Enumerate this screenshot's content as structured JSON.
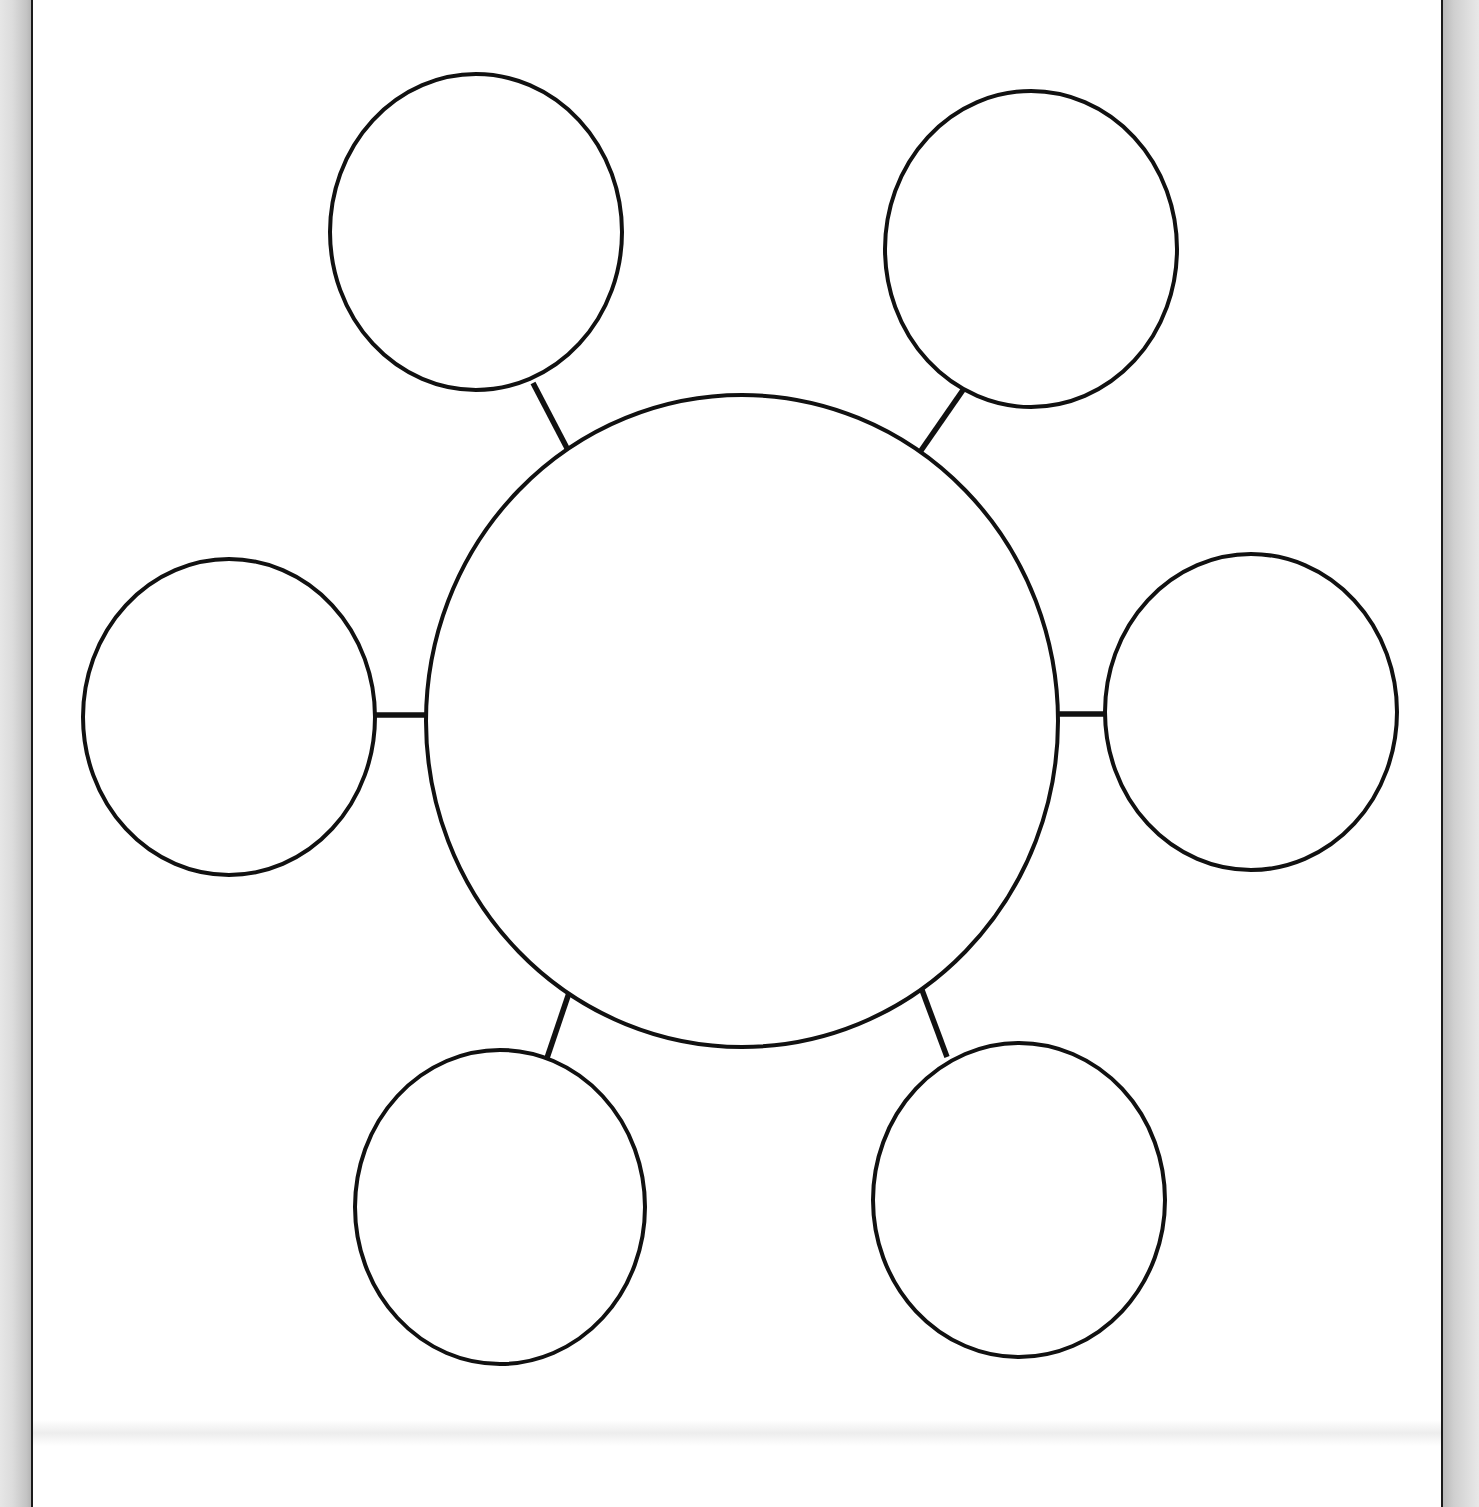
{
  "diagram": {
    "type": "bubble-map",
    "stroke_color": "#111111",
    "fill_color": "#ffffff",
    "central_circle": {
      "cx": 742,
      "cy": 721,
      "rx": 316,
      "ry": 326,
      "label": ""
    },
    "satellites": [
      {
        "id": "top-left",
        "cx": 476,
        "cy": 232,
        "rx": 146,
        "ry": 158,
        "label": ""
      },
      {
        "id": "top-right",
        "cx": 1031,
        "cy": 249,
        "rx": 146,
        "ry": 158,
        "label": ""
      },
      {
        "id": "left",
        "cx": 229,
        "cy": 717,
        "rx": 146,
        "ry": 158,
        "label": ""
      },
      {
        "id": "right",
        "cx": 1251,
        "cy": 712,
        "rx": 146,
        "ry": 158,
        "label": ""
      },
      {
        "id": "bottom-left",
        "cx": 500,
        "cy": 1207,
        "rx": 145,
        "ry": 157,
        "label": ""
      },
      {
        "id": "bottom-right",
        "cx": 1019,
        "cy": 1200,
        "rx": 146,
        "ry": 157,
        "label": ""
      }
    ],
    "connectors": [
      {
        "id": "top-left",
        "x1": 533,
        "y1": 383,
        "x2": 569,
        "y2": 452
      },
      {
        "id": "top-right",
        "x1": 963,
        "y1": 390,
        "x2": 920,
        "y2": 452
      },
      {
        "id": "left",
        "x1": 375,
        "y1": 715,
        "x2": 428,
        "y2": 715
      },
      {
        "id": "right",
        "x1": 1058,
        "y1": 714,
        "x2": 1105,
        "y2": 714
      },
      {
        "id": "bottom-left",
        "x1": 570,
        "y1": 990,
        "x2": 547,
        "y2": 1058
      },
      {
        "id": "bottom-right",
        "x1": 922,
        "y1": 990,
        "x2": 947,
        "y2": 1057
      }
    ]
  }
}
